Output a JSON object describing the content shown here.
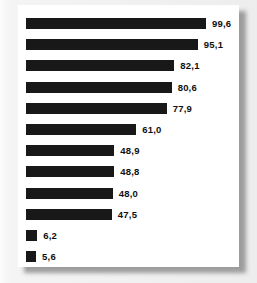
{
  "chart_data": {
    "type": "bar",
    "orientation": "horizontal",
    "title": "",
    "subtitle": "",
    "xlabel": "",
    "ylabel": "",
    "grid": false,
    "legend": null,
    "legend_position": "none",
    "axis_visible": false,
    "tick_labels_visible": false,
    "decimal_separator": ",",
    "categories": [
      "",
      "",
      "",
      "",
      "",
      "",
      "",
      "",
      "",
      "",
      "",
      ""
    ],
    "values": [
      99.6,
      95.1,
      82.1,
      80.6,
      77.9,
      61.0,
      48.9,
      48.8,
      48.0,
      47.5,
      6.2,
      5.6
    ],
    "value_labels": [
      "99,6",
      "95,1",
      "82,1",
      "80,6",
      "77,9",
      "61,0",
      "48,9",
      "48,8",
      "48,0",
      "47,5",
      "6,2",
      "5,6"
    ],
    "xlim": [
      0,
      99.6
    ],
    "bar_color": "#141414",
    "label_color": "#101010",
    "panel_color": "#ffffff",
    "background_color": "#f0f0f0"
  },
  "bars": [
    {
      "label": "99,6",
      "value": 99.6
    },
    {
      "label": "95,1",
      "value": 95.1
    },
    {
      "label": "82,1",
      "value": 82.1
    },
    {
      "label": "80,6",
      "value": 80.6
    },
    {
      "label": "77,9",
      "value": 77.9
    },
    {
      "label": "61,0",
      "value": 61.0
    },
    {
      "label": "48,9",
      "value": 48.9
    },
    {
      "label": "48,8",
      "value": 48.8
    },
    {
      "label": "48,0",
      "value": 48.0
    },
    {
      "label": "47,5",
      "value": 47.5
    },
    {
      "label": "6,2",
      "value": 6.2
    },
    {
      "label": "5,6",
      "value": 5.6
    }
  ]
}
